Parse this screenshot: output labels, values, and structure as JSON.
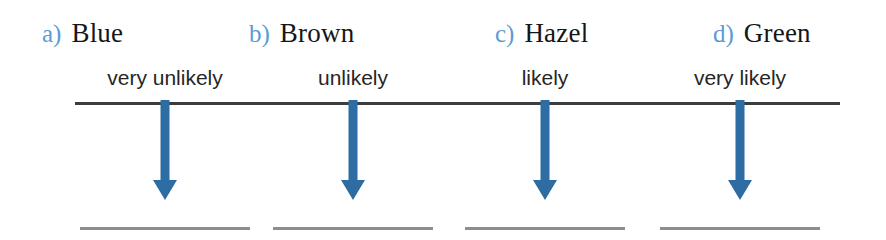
{
  "worksheet": {
    "title": "Eye colour likelihood worksheet",
    "axis_label": "likelihood-scale-line",
    "colors": {
      "marker_blue": "#5B9BD5",
      "arrow_blue": "#2E6DA4",
      "axis_dark": "#3C3C3C",
      "blank_gray": "#8D8D8D",
      "text_black": "#161616"
    },
    "items": [
      {
        "marker": "a)",
        "name": "Blue",
        "likelihood": "very unlikely",
        "arrow": "down-arrow-icon",
        "answer_blank": ""
      },
      {
        "marker": "b)",
        "name": "Brown",
        "likelihood": "unlikely",
        "arrow": "down-arrow-icon",
        "answer_blank": ""
      },
      {
        "marker": "c)",
        "name": "Hazel",
        "likelihood": "likely",
        "arrow": "down-arrow-icon",
        "answer_blank": ""
      },
      {
        "marker": "d)",
        "name": "Green",
        "likelihood": "very likely",
        "arrow": "down-arrow-icon",
        "answer_blank": ""
      }
    ]
  }
}
